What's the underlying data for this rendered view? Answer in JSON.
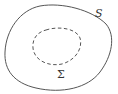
{
  "diagram": {
    "outer_curve": {
      "label": "S",
      "style": "solid",
      "color": "#555555"
    },
    "inner_curve": {
      "label": "Σ",
      "style": "dashed",
      "color": "#555555"
    }
  }
}
